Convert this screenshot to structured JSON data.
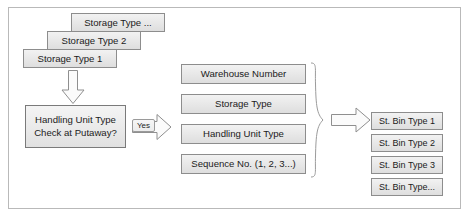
{
  "diagram": {
    "storage_type_stack": [
      {
        "label": "Storage Type ..."
      },
      {
        "label": "Storage Type 2"
      },
      {
        "label": "Storage Type 1"
      }
    ],
    "decision": {
      "line1": "Handling Unit Type",
      "line2": "Check at Putaway?"
    },
    "decision_branch_label": "Yes",
    "criteria": [
      {
        "label": "Warehouse Number"
      },
      {
        "label": "Storage Type"
      },
      {
        "label": "Handling Unit Type"
      },
      {
        "label": "Sequence No. (1, 2, 3...)"
      }
    ],
    "results": [
      {
        "label": "St. Bin Type 1"
      },
      {
        "label": "St. Bin Type 2"
      },
      {
        "label": "St. Bin Type 3"
      },
      {
        "label": "St. Bin Type..."
      }
    ],
    "icons": {
      "down_arrow": "arrow-down-icon",
      "right_arrow_yes": "arrow-right-icon",
      "right_arrow_result": "arrow-right-icon",
      "group_brace": "curly-brace-icon"
    },
    "colors": {
      "box_border": "#8d8d8d",
      "box_fill_top": "#f2f2f2",
      "box_fill_bottom": "#dedede",
      "frame_border": "#b9b9b9",
      "arrow_stroke": "#8f8f8f",
      "arrow_fill": "#fbfbfb",
      "text": "#1b1b1b"
    }
  }
}
